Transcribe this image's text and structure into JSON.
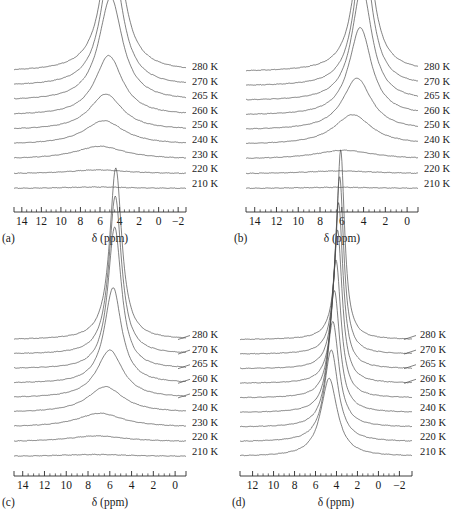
{
  "figure": {
    "type": "stacked-nmr-spectra",
    "background_color": "#ffffff",
    "trace_color": "#4a4a4a",
    "axis_color": "#2b2b2b",
    "axis_title": "δ (ppm)",
    "temperature_unit": "K"
  },
  "chart_data": [
    {
      "type": "line",
      "panel": "(a)",
      "title": "",
      "xlabel": "δ (ppm)",
      "ylabel": "",
      "xlim": [
        14.8,
        -2.8
      ],
      "x_reversed": true,
      "ticks": [
        14,
        12,
        10,
        8,
        6,
        4,
        2,
        0,
        -2
      ],
      "tick_labels": [
        "14",
        "12",
        "10",
        "8",
        "6",
        "4",
        "2",
        "0",
        "−2"
      ],
      "minor_ticks_between": 3,
      "grid": false,
      "legend_position": "right",
      "baseline_step": 15.0,
      "series": [
        {
          "name": "280 K",
          "label": "280 K",
          "center": 4.7,
          "width": 2.5,
          "amplitude": 152,
          "leader": false
        },
        {
          "name": "270 K",
          "label": "270 K",
          "center": 4.8,
          "width": 2.6,
          "amplitude": 130,
          "leader": false
        },
        {
          "name": "265 K",
          "label": "265 K",
          "center": 4.9,
          "width": 2.9,
          "amplitude": 104,
          "leader": false
        },
        {
          "name": "260 K",
          "label": "260 K",
          "center": 5.1,
          "width": 3.4,
          "amplitude": 60,
          "leader": false
        },
        {
          "name": "250 K",
          "label": "250 K",
          "center": 5.4,
          "width": 4.1,
          "amplitude": 36,
          "leader": false
        },
        {
          "name": "240 K",
          "label": "240 K",
          "center": 5.6,
          "width": 5.0,
          "amplitude": 24,
          "leader": false
        },
        {
          "name": "230 K",
          "label": "230 K",
          "center": 6.0,
          "width": 6.2,
          "amplitude": 13,
          "leader": false
        },
        {
          "name": "220 K",
          "label": "220 K",
          "center": 6.2,
          "width": 7.5,
          "amplitude": 4,
          "leader": false
        },
        {
          "name": "210 K",
          "label": "210 K",
          "center": 6.4,
          "width": 8.0,
          "amplitude": 1.5,
          "leader": false
        }
      ]
    },
    {
      "type": "line",
      "panel": "(b)",
      "title": "",
      "xlabel": "δ (ppm)",
      "ylabel": "",
      "xlim": [
        14.8,
        -1.0
      ],
      "x_reversed": true,
      "ticks": [
        14,
        12,
        10,
        8,
        6,
        4,
        2,
        0
      ],
      "tick_labels": [
        "14",
        "12",
        "10",
        "8",
        "6",
        "4",
        "2",
        "0"
      ],
      "minor_ticks_between": 3,
      "grid": false,
      "legend_position": "right",
      "baseline_step": 15.0,
      "series": [
        {
          "name": "280 K",
          "label": "280 K",
          "center": 4.0,
          "width": 1.9,
          "amplitude": 158,
          "leader": false
        },
        {
          "name": "270 K",
          "label": "270 K",
          "center": 4.05,
          "width": 2.0,
          "amplitude": 136,
          "leader": false
        },
        {
          "name": "265 K",
          "label": "265 K",
          "center": 4.15,
          "width": 2.2,
          "amplitude": 114,
          "leader": false
        },
        {
          "name": "260 K",
          "label": "260 K",
          "center": 4.3,
          "width": 2.5,
          "amplitude": 88,
          "leader": false
        },
        {
          "name": "250 K",
          "label": "250 K",
          "center": 4.6,
          "width": 3.2,
          "amplitude": 52,
          "leader": false
        },
        {
          "name": "240 K",
          "label": "240 K",
          "center": 5.0,
          "width": 4.2,
          "amplitude": 30,
          "leader": false
        },
        {
          "name": "230 K",
          "label": "230 K",
          "center": 5.8,
          "width": 6.5,
          "amplitude": 9,
          "leader": false
        },
        {
          "name": "220 K",
          "label": "220 K",
          "center": 6.2,
          "width": 8.0,
          "amplitude": 3,
          "leader": false
        },
        {
          "name": "210 K",
          "label": "210 K",
          "center": 6.4,
          "width": 8.5,
          "amplitude": 1.2,
          "leader": false
        }
      ]
    },
    {
      "type": "line",
      "panel": "(c)",
      "title": "",
      "xlabel": "δ (ppm)",
      "ylabel": "",
      "xlim": [
        14.8,
        -1.0
      ],
      "x_reversed": true,
      "ticks": [
        14,
        12,
        10,
        8,
        6,
        4,
        2,
        0
      ],
      "tick_labels": [
        "14",
        "12",
        "10",
        "8",
        "6",
        "4",
        "2",
        "0"
      ],
      "minor_ticks_between": 3,
      "grid": false,
      "legend_position": "right",
      "baseline_step": 15.5,
      "series": [
        {
          "name": "280 K",
          "label": "280 K",
          "center": 5.45,
          "width": 1.35,
          "amplitude": 172,
          "leader": true
        },
        {
          "name": "270 K",
          "label": "270 K",
          "center": 5.5,
          "width": 1.4,
          "amplitude": 158,
          "leader": true
        },
        {
          "name": "265 K",
          "label": "265 K",
          "center": 5.55,
          "width": 1.5,
          "amplitude": 142,
          "leader": true
        },
        {
          "name": "260 K",
          "label": "260 K",
          "center": 5.7,
          "width": 1.9,
          "amplitude": 96,
          "leader": true
        },
        {
          "name": "250 K",
          "label": "250 K",
          "center": 6.0,
          "width": 2.9,
          "amplitude": 48,
          "leader": true
        },
        {
          "name": "240 K",
          "label": "240 K",
          "center": 6.4,
          "width": 4.0,
          "amplitude": 26,
          "leader": false
        },
        {
          "name": "230 K",
          "label": "230 K",
          "center": 6.9,
          "width": 5.2,
          "amplitude": 14,
          "leader": false
        },
        {
          "name": "220 K",
          "label": "220 K",
          "center": 7.2,
          "width": 6.5,
          "amplitude": 6,
          "leader": false
        },
        {
          "name": "210 K",
          "label": "210 K",
          "center": 7.4,
          "width": 8.0,
          "amplitude": 2,
          "leader": false
        }
      ]
    },
    {
      "type": "line",
      "panel": "(d)",
      "title": "",
      "xlabel": "δ (ppm)",
      "ylabel": "",
      "xlim": [
        13.2,
        -3.2
      ],
      "x_reversed": true,
      "ticks": [
        12,
        10,
        8,
        6,
        4,
        2,
        0,
        -2
      ],
      "tick_labels": [
        "12",
        "10",
        "8",
        "6",
        "4",
        "2",
        "0",
        "−2"
      ],
      "minor_ticks_between": 3,
      "grid": false,
      "legend_position": "right",
      "baseline_step": 15.5,
      "series": [
        {
          "name": "280 K",
          "label": "280 K",
          "center": 3.6,
          "width": 0.9,
          "amplitude": 190,
          "leader": true
        },
        {
          "name": "270 K",
          "label": "270 K",
          "center": 3.7,
          "width": 0.95,
          "amplitude": 178,
          "leader": true
        },
        {
          "name": "265 K",
          "label": "265 K",
          "center": 3.8,
          "width": 1.0,
          "amplitude": 166,
          "leader": true
        },
        {
          "name": "260 K",
          "label": "260 K",
          "center": 3.9,
          "width": 1.05,
          "amplitude": 154,
          "leader": true
        },
        {
          "name": "250 K",
          "label": "250 K",
          "center": 4.05,
          "width": 1.15,
          "amplitude": 138,
          "leader": false
        },
        {
          "name": "240 K",
          "label": "240 K",
          "center": 4.2,
          "width": 1.25,
          "amplitude": 122,
          "leader": false
        },
        {
          "name": "230 K",
          "label": "230 K",
          "center": 4.35,
          "width": 1.4,
          "amplitude": 106,
          "leader": false
        },
        {
          "name": "220 K",
          "label": "220 K",
          "center": 4.5,
          "width": 1.6,
          "amplitude": 92,
          "leader": false
        },
        {
          "name": "210 K",
          "label": "210 K",
          "center": 4.7,
          "width": 1.9,
          "amplitude": 78,
          "leader": false
        }
      ]
    }
  ],
  "panels": [
    {
      "tag": "(a)",
      "axis_title": "δ (ppm)"
    },
    {
      "tag": "(b)",
      "axis_title": "δ (ppm)"
    },
    {
      "tag": "(c)",
      "axis_title": "δ (ppm)"
    },
    {
      "tag": "(d)",
      "axis_title": "δ (ppm)"
    }
  ]
}
